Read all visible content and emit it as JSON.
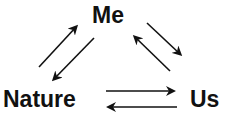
{
  "diagram": {
    "type": "cycle",
    "colors": {
      "ink": "#111111",
      "background": "#ffffff"
    },
    "nodes": [
      {
        "id": "me",
        "label": "Me"
      },
      {
        "id": "nature",
        "label": "Nature"
      },
      {
        "id": "us",
        "label": "Us"
      }
    ],
    "edges": [
      {
        "from": "nature",
        "to": "me"
      },
      {
        "from": "me",
        "to": "nature"
      },
      {
        "from": "me",
        "to": "us"
      },
      {
        "from": "us",
        "to": "me"
      },
      {
        "from": "nature",
        "to": "us"
      },
      {
        "from": "us",
        "to": "nature"
      }
    ]
  }
}
